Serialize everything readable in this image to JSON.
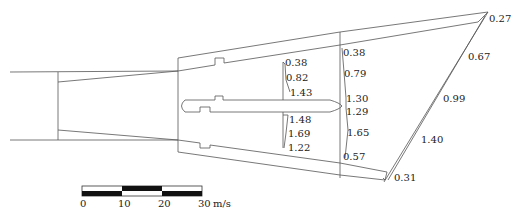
{
  "diagram": {
    "type": "flow velocity distribution diagram",
    "unit": "m/s",
    "section_1_labels": [
      "0.38",
      "0.82",
      "1.43",
      "1.48",
      "1.69",
      "1.22"
    ],
    "section_2_labels": [
      "0.38",
      "0.79",
      "1.30",
      "1.29",
      "1.65",
      "0.57"
    ],
    "outlet_labels": [
      "0.27",
      "0.67",
      "0.99",
      "1.40",
      "0.31"
    ]
  },
  "scale_bar": {
    "ticks": [
      "0",
      "10",
      "20",
      "30"
    ],
    "unit": "m/s"
  }
}
